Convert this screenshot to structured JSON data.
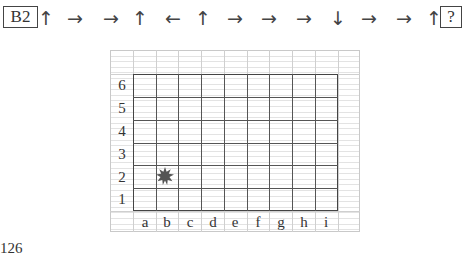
{
  "sequence": {
    "start_label": "B2",
    "arrows": [
      "↑",
      "→",
      "→",
      "↑",
      "←",
      "↑",
      "→",
      "→",
      "→",
      "↓",
      "→",
      "→",
      "↑"
    ],
    "end_label": "?"
  },
  "board": {
    "rows": [
      "6",
      "5",
      "4",
      "3",
      "2",
      "1"
    ],
    "columns": [
      "a",
      "b",
      "c",
      "d",
      "e",
      "f",
      "g",
      "h",
      "i"
    ],
    "marker": {
      "cell": "b2",
      "icon": "star-icon",
      "color": "#555555"
    }
  },
  "page_number": "126"
}
